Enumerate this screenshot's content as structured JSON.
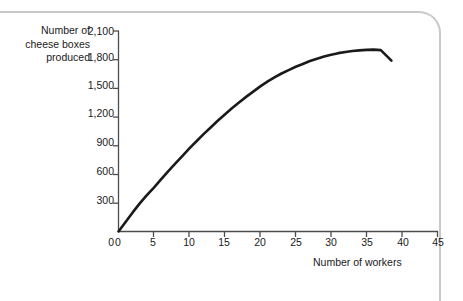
{
  "chart_data": {
    "type": "line",
    "title": "",
    "subtitle": "",
    "xlabel": "Number of workers",
    "ylabel": "Number of cheese boxes produced",
    "ylabel_lines": [
      "Number of",
      "cheese boxes",
      "produced"
    ],
    "xlim": [
      0,
      45
    ],
    "ylim": [
      0,
      2100
    ],
    "grid": false,
    "legend": null,
    "x_ticks": [
      0,
      5,
      10,
      15,
      20,
      25,
      30,
      35,
      40,
      45
    ],
    "x_tick_labels": [
      "0",
      "5",
      "10",
      "15",
      "20",
      "25",
      "30",
      "35",
      "40",
      "45"
    ],
    "y_ticks": [
      0,
      300,
      600,
      900,
      1200,
      1500,
      1800,
      2100
    ],
    "y_tick_labels": [
      "0",
      "300",
      "600",
      "900",
      "1,200",
      "1,500",
      "1,800",
      "2,100"
    ],
    "line_color": "#1a1a1a",
    "line_width": 2.6,
    "axis_color": "#4d4d4d",
    "series": [
      {
        "name": "Total product of labour",
        "x": [
          0,
          1,
          2,
          3,
          4,
          5,
          6,
          7,
          8,
          9,
          10,
          11,
          12,
          13,
          14,
          15,
          16,
          17,
          18,
          19,
          20,
          21,
          22,
          23,
          24,
          25,
          26,
          27,
          28,
          29,
          30,
          31,
          32,
          33,
          34,
          35,
          36,
          37,
          38.5
        ],
        "values": [
          0,
          100,
          200,
          295,
          380,
          460,
          545,
          630,
          710,
          790,
          870,
          945,
          1020,
          1090,
          1160,
          1225,
          1290,
          1350,
          1410,
          1465,
          1520,
          1570,
          1615,
          1655,
          1690,
          1725,
          1755,
          1785,
          1810,
          1832,
          1852,
          1868,
          1880,
          1890,
          1897,
          1902,
          1905,
          1900,
          1790
        ]
      }
    ]
  },
  "frame": {
    "border_color": "#c9c9c9"
  }
}
